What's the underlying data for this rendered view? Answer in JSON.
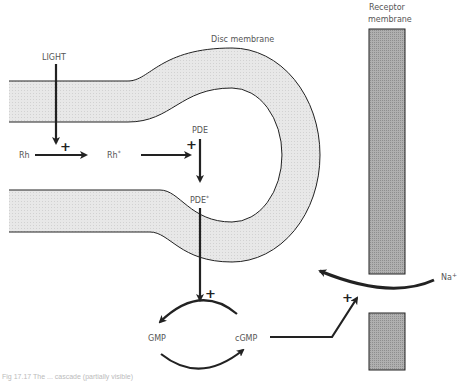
{
  "figure": {
    "labels": {
      "light": "LIGHT",
      "disc_membrane": "Disc membrane",
      "receptor_membrane_line1": "Receptor",
      "receptor_membrane_line2": "membrane",
      "rh": "Rh",
      "rh_active": "Rh",
      "rh_active_sup": "*",
      "pde": "PDE",
      "pde_active": "PDE",
      "pde_active_sup": "*",
      "gmp": "GMP",
      "cgmp": "cGMP",
      "na": "Na",
      "na_sup": "+",
      "plus": "+"
    },
    "caption": "Fig 17.17 The ... cascade (partially visible)",
    "colors": {
      "membrane_fill": "#e6e6e6",
      "receptor_fill": "#a8a8a8",
      "stroke": "#222222",
      "label": "#555555"
    }
  }
}
